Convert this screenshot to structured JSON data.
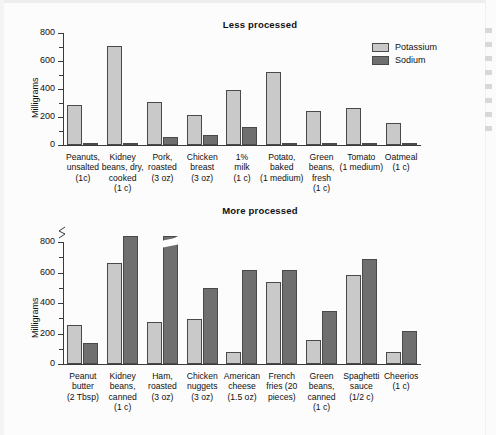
{
  "figure": {
    "ylabel": "Milligrams",
    "legend": [
      {
        "key": "potassium",
        "label": "Potassium",
        "color": "#c9c9c9"
      },
      {
        "key": "sodium",
        "label": "Sodium",
        "color": "#6f6f6f"
      }
    ]
  },
  "chart_data": [
    {
      "type": "bar",
      "title": "Less processed",
      "xlabel": "",
      "ylabel": "Milligrams",
      "ylim": [
        0,
        800
      ],
      "yticks": [
        0,
        200,
        400,
        600,
        800
      ],
      "yticks_minor": [
        100,
        300,
        500,
        700
      ],
      "grid": false,
      "legend_position": "top-right",
      "categories": [
        "Peanuts, unsalted (1c)",
        "Kidney beans, dry, cooked (1 c)",
        "Pork, roasted (3 oz)",
        "Chicken breast (3 oz)",
        "1% milk (1 c)",
        "Potato, baked (1 medium)",
        "Green beans, fresh (1 c)",
        "Tomato (1 medium)",
        "Oatmeal (1 c)"
      ],
      "category_lines": [
        [
          "Peanuts,",
          "unsalted",
          "(1c)"
        ],
        [
          "Kidney",
          "beans, dry,",
          "cooked",
          "(1 c)"
        ],
        [
          "Pork,",
          "roasted",
          "(3 oz)"
        ],
        [
          "Chicken",
          "breast",
          "(3 oz)"
        ],
        [
          "1%",
          "milk",
          "(1 c)"
        ],
        [
          "Potato,",
          "baked",
          "(1 medium)"
        ],
        [
          "Green",
          "beans,",
          "fresh",
          "(1 c)"
        ],
        [
          "Tomato",
          "(1 medium)"
        ],
        [
          "Oatmeal",
          "(1 c)"
        ]
      ],
      "series": [
        {
          "name": "Potassium",
          "color": "#c9c9c9",
          "values": [
            285,
            710,
            310,
            215,
            390,
            520,
            240,
            265,
            160
          ]
        },
        {
          "name": "Sodium",
          "color": "#6f6f6f",
          "values": [
            5,
            5,
            60,
            70,
            130,
            15,
            15,
            15,
            10
          ]
        }
      ]
    },
    {
      "type": "bar",
      "title": "More processed",
      "xlabel": "",
      "ylabel": "Milligrams",
      "ylim": [
        0,
        800
      ],
      "yticks": [
        0,
        200,
        400,
        600,
        800
      ],
      "yticks_minor": [
        100,
        300,
        500,
        700
      ],
      "axis_break": true,
      "grid": false,
      "legend_position": "none",
      "categories": [
        "Peanut butter (2 Tbsp)",
        "Kidney beans, canned (1 c)",
        "Ham, roasted (3 oz)",
        "Chicken nuggets (3 oz)",
        "American cheese (1.5 oz)",
        "French fries (20 pieces)",
        "Green beans, canned (1 c)",
        "Spaghetti sauce (1/2 c)",
        "Cheerios (1 c)"
      ],
      "category_lines": [
        [
          "Peanut",
          "butter",
          "(2 Tbsp)"
        ],
        [
          "Kidney",
          "beans,",
          "canned",
          "(1 c)"
        ],
        [
          "Ham,",
          "roasted",
          "(3 oz)"
        ],
        [
          "Chicken",
          "nuggets",
          "(3 oz)"
        ],
        [
          "American",
          "cheese",
          "(1.5 oz)"
        ],
        [
          "French",
          "fries (20",
          "pieces)"
        ],
        [
          "Green",
          "beans,",
          "canned",
          "(1 c)"
        ],
        [
          "Spaghetti",
          "sauce",
          "(1/2 c)"
        ],
        [
          "Cheerios",
          "(1 c)"
        ]
      ],
      "series": [
        {
          "name": "Potassium",
          "color": "#c9c9c9",
          "values": [
            255,
            665,
            275,
            295,
            80,
            540,
            155,
            585,
            80
          ]
        },
        {
          "name": "Sodium",
          "color": "#6f6f6f",
          "values": [
            140,
            865,
            1020,
            500,
            615,
            615,
            345,
            690,
            215
          ],
          "truncated_index": 2
        }
      ]
    }
  ]
}
